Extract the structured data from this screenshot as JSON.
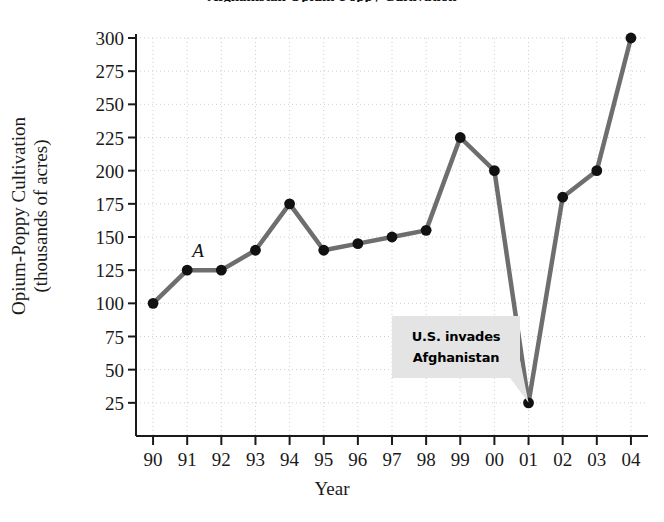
{
  "chart_data": {
    "type": "line",
    "title": "Afghanistan Opium-Poppy Cultivation",
    "xlabel": "Year",
    "ylabel_line1": "Opium-Poppy Cultivation",
    "ylabel_line2": "(thousands of acres)",
    "categories": [
      "90",
      "91",
      "92",
      "93",
      "94",
      "95",
      "96",
      "97",
      "98",
      "99",
      "00",
      "01",
      "02",
      "03",
      "04"
    ],
    "values": [
      100,
      125,
      125,
      140,
      175,
      140,
      145,
      150,
      155,
      225,
      200,
      25,
      180,
      200,
      300
    ],
    "yticks": [
      25,
      50,
      75,
      100,
      125,
      150,
      175,
      200,
      225,
      250,
      275,
      300
    ],
    "ylim": [
      0,
      300
    ],
    "grid": true,
    "legend": "none",
    "series_color": "#6e6e6e",
    "marker_color": "#111111",
    "grid_color": "#cfcfcf",
    "axis_color": "#1a1a1a",
    "annotations": [
      {
        "name": "us-invades-afghanistan",
        "line1": "U.S. invades",
        "line2": "Afghanistan",
        "points_to_category": "01",
        "points_to_value": 25
      }
    ],
    "point_labels": [
      {
        "label": "A",
        "category": "91",
        "value": 125
      }
    ]
  }
}
